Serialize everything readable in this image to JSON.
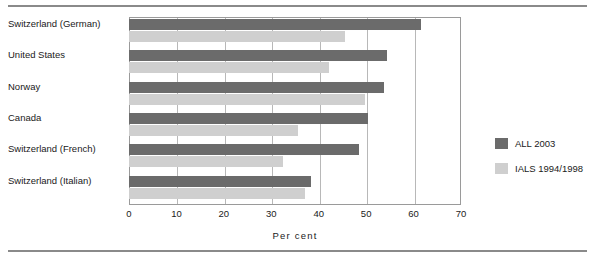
{
  "chart_data": {
    "type": "bar",
    "orientation": "horizontal",
    "title": "",
    "xlabel": "Per cent",
    "ylabel": "",
    "xlim": [
      0,
      70
    ],
    "xticks": [
      0,
      10,
      20,
      30,
      40,
      50,
      60,
      70
    ],
    "xtick_labels": [
      "0",
      "10",
      "20",
      "30",
      "40",
      "50",
      "60",
      "70"
    ],
    "grid": "vertical",
    "legend_position": "right",
    "categories": [
      "Switzerland (German)",
      "United States",
      "Norway",
      "Canada",
      "Switzerland (French)",
      "Switzerland (Italian)"
    ],
    "series": [
      {
        "name": "ALL 2003",
        "color": "#6b6b6b",
        "values": [
          61.5,
          54.5,
          53.7,
          50.3,
          48.5,
          38.3
        ]
      },
      {
        "name": "IALS 1994/1998",
        "color": "#cfcfcf",
        "values": [
          45.5,
          42.2,
          49.7,
          35.6,
          32.4,
          37.1
        ]
      }
    ]
  },
  "legend": {
    "items": [
      {
        "label": "ALL 2003",
        "color": "#6b6b6b"
      },
      {
        "label": "IALS 1994/1998",
        "color": "#cfcfcf"
      }
    ]
  }
}
